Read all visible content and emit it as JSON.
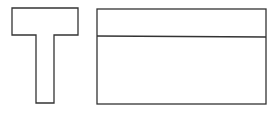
{
  "diagram": {
    "stroke_color": "#333333",
    "background": "#ffffff",
    "shapes": [
      {
        "id": "t-shape",
        "type": "polygon",
        "points": "12,8 78,8 78,35 54,35 54,103 36,103 36,35 12,35"
      },
      {
        "id": "rectangle",
        "type": "rect",
        "x": 97,
        "y": 9,
        "width": 169,
        "height": 95
      },
      {
        "id": "rectangle-divider",
        "type": "line",
        "x1": 97,
        "y1": 36,
        "x2": 266,
        "y2": 37
      }
    ]
  }
}
